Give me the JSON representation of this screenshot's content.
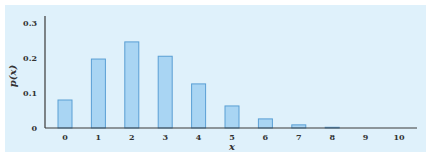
{
  "chart_data": {
    "type": "bar",
    "title": "",
    "xlabel": "x",
    "ylabel": "p(x)",
    "categories": [
      "0",
      "1",
      "2",
      "3",
      "4",
      "5",
      "6",
      "7",
      "8",
      "9",
      "10"
    ],
    "values": [
      0.08,
      0.197,
      0.246,
      0.205,
      0.126,
      0.063,
      0.026,
      0.009,
      0.002,
      0.0,
      0.0
    ],
    "ylim": [
      0,
      0.3
    ],
    "yticks": [
      "0",
      "0.1",
      "0.2",
      "0.3"
    ],
    "grid": false,
    "legend": null
  },
  "colors": {
    "background": "#dff1fb",
    "bar_fill": "#a9d5f3",
    "bar_stroke": "#5a9fd4",
    "axis": "#3a3a3a"
  }
}
